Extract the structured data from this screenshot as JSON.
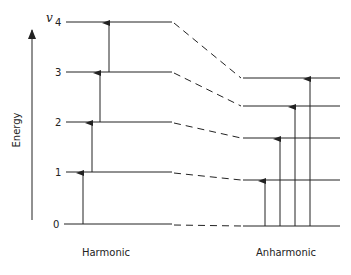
{
  "diagram": {
    "type": "energy-level-diagram",
    "axis_label": "Energy",
    "quantum_number_symbol": "v",
    "level_labels": [
      "0",
      "1",
      "2",
      "3",
      "4"
    ],
    "columns": [
      {
        "name": "Harmonic",
        "level_y": [
          224,
          172,
          122,
          72,
          22
        ]
      },
      {
        "name": "Anharmonic",
        "level_y": [
          226,
          180,
          138,
          106,
          78
        ]
      }
    ],
    "harmonic_transitions": [
      "0→1",
      "1→2",
      "2→3",
      "3→4"
    ],
    "anharmonic_transitions": [
      "0→1",
      "0→2",
      "0→3",
      "0→4"
    ],
    "colors": {
      "line": "#222222",
      "background": "#ffffff"
    }
  }
}
